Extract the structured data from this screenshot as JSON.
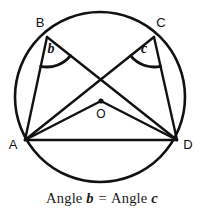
{
  "figure": {
    "type": "circle-geometry-diagram",
    "stroke_color": "#111111",
    "background_color": "#ffffff",
    "circle": {
      "label": "circumscribed-circle",
      "center_x": 100,
      "center_y": 97,
      "radius": 85
    },
    "center_point": {
      "label": "O",
      "x": 101,
      "y": 101,
      "dot_radius": 2.6,
      "label_x": 101,
      "label_y": 118
    },
    "points": [
      {
        "id": "A",
        "label": "A",
        "x": 25,
        "y": 140,
        "label_x": 13,
        "label_y": 149
      },
      {
        "id": "B",
        "label": "B",
        "x": 47,
        "y": 37,
        "label_x": 40,
        "label_y": 27
      },
      {
        "id": "C",
        "label": "C",
        "x": 154,
        "y": 37,
        "label_x": 161,
        "label_y": 27
      },
      {
        "id": "D",
        "label": "D",
        "x": 177,
        "y": 140,
        "label_x": 188,
        "label_y": 149
      }
    ],
    "segments": [
      {
        "name": "chord-AB",
        "from": "A",
        "to": "B"
      },
      {
        "name": "chord-CD",
        "from": "C",
        "to": "D"
      },
      {
        "name": "chord-AD",
        "from": "A",
        "to": "D"
      },
      {
        "name": "chord-BD",
        "from": "B",
        "to": "D"
      },
      {
        "name": "chord-AC",
        "from": "A",
        "to": "C"
      },
      {
        "name": "radius-OA",
        "from": "O",
        "to": "A"
      },
      {
        "name": "radius-OD",
        "from": "O",
        "to": "D"
      }
    ],
    "angles": [
      {
        "id": "b",
        "label": "b",
        "vertex": "B",
        "rays": [
          "A",
          "D"
        ],
        "arc_radius": 30,
        "label_x": 51,
        "label_y": 53
      },
      {
        "id": "c",
        "label": "c",
        "vertex": "C",
        "rays": [
          "A",
          "D"
        ],
        "arc_radius": 30,
        "label_x": 144,
        "label_y": 53
      }
    ]
  },
  "caption": {
    "prefix": "Angle",
    "angle_one": "b",
    "equals": "=",
    "prefix_two": "Angle",
    "angle_two": "c",
    "full_text": "Angle b = Angle c"
  }
}
